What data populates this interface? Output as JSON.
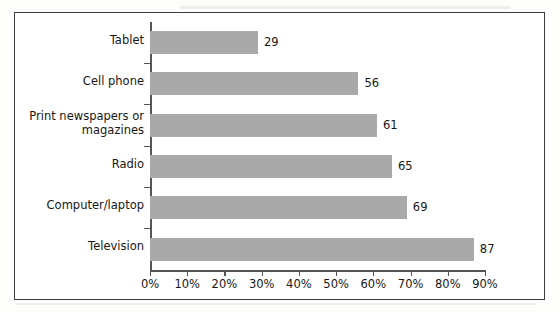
{
  "chart_data": {
    "type": "bar",
    "orientation": "horizontal",
    "title": "",
    "xlabel": "",
    "ylabel": "",
    "categories": [
      "Tablet",
      "Cell phone",
      "Print newspapers or magazines",
      "Radio",
      "Computer/laptop",
      "Television"
    ],
    "category_labels_display": [
      [
        "Tablet"
      ],
      [
        "Cell phone"
      ],
      [
        "Print newspapers or",
        "magazines"
      ],
      [
        "Radio"
      ],
      [
        "Computer/laptop"
      ],
      [
        "Television"
      ]
    ],
    "values": [
      29,
      56,
      61,
      65,
      69,
      87
    ],
    "value_labels": [
      "29",
      "56",
      "61",
      "65",
      "69",
      "87"
    ],
    "xlim": [
      0,
      90
    ],
    "xticks": [
      0,
      10,
      20,
      30,
      40,
      50,
      60,
      70,
      80,
      90
    ],
    "xtick_labels": [
      "0%",
      "10%",
      "20%",
      "30%",
      "40%",
      "50%",
      "60%",
      "70%",
      "80%",
      "90%"
    ],
    "grid": false,
    "legend": null,
    "bar_color": "#a9a9a9",
    "axis_color": "#555555",
    "frame_color": "#3b3b3b",
    "text_color": "#171717",
    "background": "#ffffff"
  }
}
